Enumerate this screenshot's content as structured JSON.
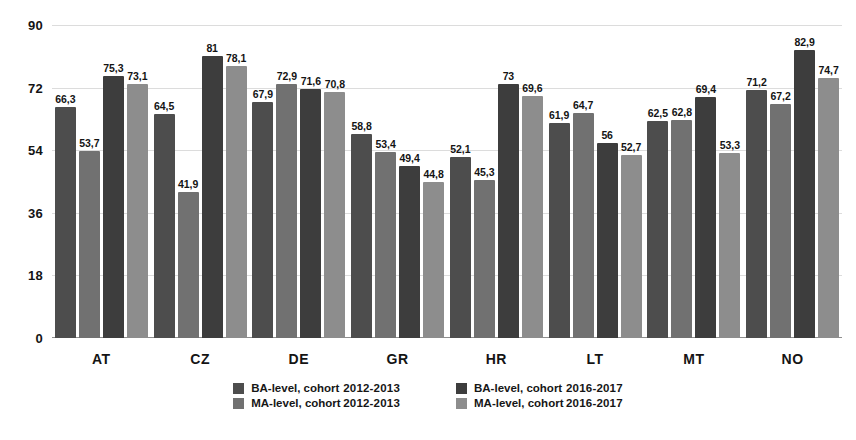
{
  "chart_data": {
    "type": "bar",
    "title": "",
    "subtitle": "",
    "xlabel": "",
    "ylabel": "",
    "ylim": [
      0,
      90
    ],
    "yticks": [
      0,
      18,
      36,
      54,
      72,
      90
    ],
    "ytick_labels": [
      "0",
      "18",
      "36",
      "54",
      "72",
      "90"
    ],
    "grid": true,
    "grid_axis": "y",
    "legend_position": "bottom",
    "decimal_separator": ",",
    "categories": [
      "AT",
      "CZ",
      "DE",
      "GR",
      "HR",
      "LT",
      "MT",
      "NO"
    ],
    "series": [
      {
        "name": "BA-level, cohort 2012-2013",
        "level": "BA-level, cohort",
        "period": "2012-2013",
        "color": "#4d4d4d",
        "values": [
          66.3,
          64.5,
          67.9,
          58.8,
          52.1,
          61.9,
          62.5,
          71.2
        ],
        "labels": [
          "66,3",
          "64,5",
          "67,9",
          "58,8",
          "52,1",
          "61,9",
          "62,5",
          "71,2"
        ]
      },
      {
        "name": "MA-level, cohort 2012-2013",
        "level": "MA-level, cohort",
        "period": "2012-2013",
        "color": "#717171",
        "values": [
          53.7,
          41.9,
          72.9,
          53.4,
          45.3,
          64.7,
          62.8,
          67.2
        ],
        "labels": [
          "53,7",
          "41,9",
          "72,9",
          "53,4",
          "45,3",
          "64,7",
          "62,8",
          "67,2"
        ]
      },
      {
        "name": "BA-level, cohort 2016-2017",
        "level": "BA-level, cohort",
        "period": "2016-2017",
        "color": "#3d3d3d",
        "values": [
          75.3,
          81,
          71.6,
          49.4,
          73,
          56,
          69.4,
          82.9
        ],
        "labels": [
          "75,3",
          "81",
          "71,6",
          "49,4",
          "73",
          "56",
          "69,4",
          "82,9"
        ]
      },
      {
        "name": "MA-level, cohort 2016-2017",
        "level": "MA-level, cohort",
        "period": "2016-2017",
        "color": "#8d8d8d",
        "values": [
          73.1,
          78.1,
          70.8,
          44.8,
          69.6,
          52.7,
          53.3,
          74.7
        ],
        "labels": [
          "73,1",
          "78,1",
          "70,8",
          "44,8",
          "69,6",
          "52,7",
          "53,3",
          "74,7"
        ]
      }
    ]
  },
  "legend": {
    "columns": [
      {
        "rows": [
          {
            "level": "BA-level, cohort",
            "period": "2012-2013",
            "color": "#4d4d4d"
          },
          {
            "level": "MA-level, cohort",
            "period": "2012-2013",
            "color": "#717171"
          }
        ]
      },
      {
        "rows": [
          {
            "level": "BA-level, cohort",
            "period": "2016-2017",
            "color": "#3d3d3d"
          },
          {
            "level": "MA-level, cohort",
            "period": "2016-2017",
            "color": "#8d8d8d"
          }
        ]
      }
    ]
  },
  "colors": {
    "background": "#ffffff",
    "gridline": "#dcdcdc",
    "axis": "#8e8e8e",
    "text": "#141414"
  }
}
